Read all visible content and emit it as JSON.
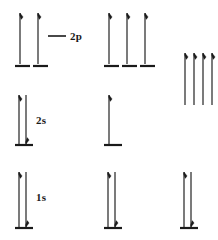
{
  "figure": {
    "type": "orbital-energy-level-diagram",
    "background": "#ffffff",
    "ink_color": "#1a1a1a",
    "width": 218,
    "height": 240
  },
  "labels": {
    "p_level": "2p",
    "s_level_outer": "2s",
    "s_level_inner": "1s"
  },
  "leader": {
    "visible": true,
    "x1": 48,
    "x2": 66,
    "y": 36
  },
  "levels": [
    {
      "name": "2p",
      "label": "2p",
      "label_x": 70,
      "label_y": 30,
      "groups": [
        {
          "column": 1,
          "orbital_lines": [
            {
              "x": 15,
              "y": 66,
              "width": 15
            },
            {
              "x": 33,
              "y": 66,
              "width": 15
            }
          ],
          "arrows": [
            {
              "x": 20,
              "top": 13,
              "bottom": 64,
              "direction": "up"
            },
            {
              "x": 38,
              "top": 13,
              "bottom": 64,
              "direction": "up"
            }
          ]
        },
        {
          "column": 2,
          "orbital_lines": [
            {
              "x": 104,
              "y": 66,
              "width": 15
            },
            {
              "x": 122,
              "y": 66,
              "width": 15
            },
            {
              "x": 140,
              "y": 66,
              "width": 15
            }
          ],
          "arrows": [
            {
              "x": 109,
              "top": 13,
              "bottom": 64,
              "direction": "up"
            },
            {
              "x": 127,
              "top": 13,
              "bottom": 64,
              "direction": "up"
            },
            {
              "x": 145,
              "top": 13,
              "bottom": 64,
              "direction": "up"
            }
          ]
        },
        {
          "column": 3,
          "orbital_lines": [],
          "arrows": [
            {
              "x": 185,
              "top": 53,
              "bottom": 105,
              "direction": "up"
            },
            {
              "x": 194,
              "top": 53,
              "bottom": 105,
              "direction": "up"
            },
            {
              "x": 203,
              "top": 53,
              "bottom": 105,
              "direction": "up"
            },
            {
              "x": 212,
              "top": 53,
              "bottom": 105,
              "direction": "up"
            }
          ]
        }
      ]
    },
    {
      "name": "2s",
      "label": "2s",
      "label_x": 36,
      "label_y": 114,
      "groups": [
        {
          "column": 1,
          "orbital_lines": [
            {
              "x": 15,
              "y": 145,
              "width": 18
            }
          ],
          "arrows": [
            {
              "x": 19,
              "top": 95,
              "bottom": 144,
              "direction": "up"
            },
            {
              "x": 26,
              "top": 95,
              "bottom": 144,
              "direction": "down"
            }
          ]
        },
        {
          "column": 2,
          "orbital_lines": [
            {
              "x": 104,
              "y": 145,
              "width": 18
            }
          ],
          "arrows": [
            {
              "x": 109,
              "top": 95,
              "bottom": 144,
              "direction": "up"
            }
          ]
        },
        {
          "column": 3,
          "orbital_lines": [],
          "arrows": []
        }
      ]
    },
    {
      "name": "1s",
      "label": "1s",
      "label_x": 36,
      "label_y": 191,
      "groups": [
        {
          "column": 1,
          "orbital_lines": [
            {
              "x": 15,
              "y": 228,
              "width": 18
            }
          ],
          "arrows": [
            {
              "x": 19,
              "top": 172,
              "bottom": 227,
              "direction": "up"
            },
            {
              "x": 26,
              "top": 172,
              "bottom": 227,
              "direction": "down"
            }
          ]
        },
        {
          "column": 2,
          "orbital_lines": [
            {
              "x": 104,
              "y": 228,
              "width": 18
            }
          ],
          "arrows": [
            {
              "x": 108,
              "top": 172,
              "bottom": 227,
              "direction": "up"
            },
            {
              "x": 115,
              "top": 172,
              "bottom": 227,
              "direction": "down"
            }
          ]
        },
        {
          "column": 3,
          "orbital_lines": [
            {
              "x": 180,
              "y": 228,
              "width": 18
            }
          ],
          "arrows": [
            {
              "x": 184,
              "top": 172,
              "bottom": 227,
              "direction": "up"
            },
            {
              "x": 191,
              "top": 172,
              "bottom": 227,
              "direction": "down"
            }
          ]
        }
      ]
    }
  ]
}
